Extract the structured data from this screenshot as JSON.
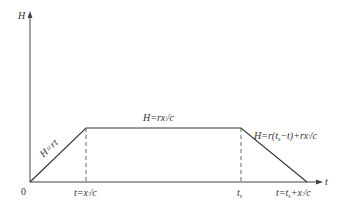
{
  "diagram": {
    "type": "trapezoidal time history",
    "axes": {
      "y_label": "H",
      "x_label": "t",
      "origin_label": "0"
    },
    "segments": [
      {
        "name": "rise",
        "equation": "H=rt"
      },
      {
        "name": "plateau",
        "equation": "H=rx′/c"
      },
      {
        "name": "fall",
        "equation": "H=r(ts−t)+rx′/c"
      }
    ],
    "x_ticks": [
      {
        "label": "t=x′/c"
      },
      {
        "label": "ts"
      },
      {
        "label": "t=ts+x′/c"
      }
    ],
    "colors": {
      "line": "#333333",
      "background": "#ffffff"
    }
  }
}
